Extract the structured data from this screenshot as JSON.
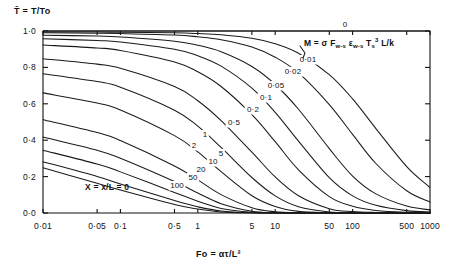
{
  "chart_data": {
    "type": "line",
    "title": "",
    "xlabel": "Fo = ατ/L²",
    "ylabel": "T̄ = T/To",
    "xscale": "log",
    "xlim": [
      0.01,
      1000
    ],
    "ylim": [
      0.0,
      1.0
    ],
    "grid": false,
    "legend_position": "inline-curve-labels",
    "x_tick_labels": [
      "0·01",
      "0·05",
      "0·1",
      "0·5",
      "1",
      "5",
      "10",
      "50",
      "100",
      "500",
      "1000"
    ],
    "x_tick_values": [
      0.01,
      0.05,
      0.1,
      0.5,
      1,
      5,
      10,
      50,
      100,
      500,
      1000
    ],
    "y_tick_labels": [
      "1·0",
      "0·8",
      "0·6",
      "0·4",
      "0·2",
      "0·0"
    ],
    "y_tick_values": [
      1.0,
      0.8,
      0.6,
      0.4,
      0.2,
      0.0
    ],
    "annotation_formula": "M = σ F",
    "annotation_formula_sub1": "w-s",
    "annotation_formula_mid": " ε",
    "annotation_formula_sub2": "w-s",
    "annotation_formula_T": " T",
    "annotation_formula_Tsub": "s",
    "annotation_formula_Tsup": "3",
    "annotation_formula_tail": " L/k",
    "annotation_position_note": "M=",
    "inside_label": "X = x/L = 0",
    "series_param_name": "M",
    "series": [
      {
        "name": "0",
        "label": "0",
        "M": 0
      },
      {
        "name": "0.01",
        "label": "0·01",
        "M": 0.01
      },
      {
        "name": "0.02",
        "label": "0·02",
        "M": 0.02
      },
      {
        "name": "0.05",
        "label": "0·05",
        "M": 0.05
      },
      {
        "name": "0.1",
        "label": "0·1",
        "M": 0.1
      },
      {
        "name": "0.2",
        "label": "0·2",
        "M": 0.2
      },
      {
        "name": "0.5",
        "label": "0·5",
        "M": 0.5
      },
      {
        "name": "1",
        "label": "1",
        "M": 1
      },
      {
        "name": "2",
        "label": "2",
        "M": 2
      },
      {
        "name": "5",
        "label": "5",
        "M": 5
      },
      {
        "name": "10",
        "label": "10",
        "M": 10
      },
      {
        "name": "20",
        "label": "20",
        "M": 20
      },
      {
        "name": "50",
        "label": "50",
        "M": 50
      },
      {
        "name": "100",
        "label": "100",
        "M": 100
      }
    ],
    "curve_points": {
      "0": [
        [
          0.01,
          1.0
        ],
        [
          0.1,
          1.0
        ],
        [
          1,
          1.0
        ],
        [
          10,
          1.0
        ],
        [
          100,
          1.0
        ],
        [
          1000,
          1.0
        ]
      ],
      "0.01": [
        [
          0.01,
          0.995
        ],
        [
          0.05,
          0.994
        ],
        [
          0.1,
          0.993
        ],
        [
          0.5,
          0.99
        ],
        [
          1,
          0.986
        ],
        [
          2,
          0.979
        ],
        [
          5,
          0.96
        ],
        [
          10,
          0.93
        ],
        [
          20,
          0.878
        ],
        [
          50,
          0.76
        ],
        [
          100,
          0.627
        ],
        [
          200,
          0.464
        ],
        [
          500,
          0.255
        ],
        [
          1000,
          0.14
        ]
      ],
      "0.02": [
        [
          0.01,
          0.99
        ],
        [
          0.05,
          0.988
        ],
        [
          0.1,
          0.986
        ],
        [
          0.5,
          0.978
        ],
        [
          1,
          0.968
        ],
        [
          2,
          0.952
        ],
        [
          5,
          0.912
        ],
        [
          10,
          0.856
        ],
        [
          20,
          0.77
        ],
        [
          50,
          0.596
        ],
        [
          100,
          0.432
        ],
        [
          200,
          0.272
        ],
        [
          500,
          0.122
        ],
        [
          1000,
          0.06
        ]
      ],
      "0.05": [
        [
          0.01,
          0.977
        ],
        [
          0.05,
          0.972
        ],
        [
          0.1,
          0.967
        ],
        [
          0.5,
          0.944
        ],
        [
          1,
          0.922
        ],
        [
          2,
          0.886
        ],
        [
          5,
          0.805
        ],
        [
          10,
          0.706
        ],
        [
          20,
          0.57
        ],
        [
          50,
          0.354
        ],
        [
          100,
          0.203
        ],
        [
          200,
          0.105
        ],
        [
          500,
          0.038
        ],
        [
          1000,
          0.017
        ]
      ],
      "0.1": [
        [
          0.01,
          0.957
        ],
        [
          0.05,
          0.948
        ],
        [
          0.1,
          0.94
        ],
        [
          0.5,
          0.9
        ],
        [
          1,
          0.864
        ],
        [
          2,
          0.807
        ],
        [
          5,
          0.686
        ],
        [
          10,
          0.553
        ],
        [
          20,
          0.395
        ],
        [
          50,
          0.194
        ],
        [
          100,
          0.094
        ],
        [
          200,
          0.042
        ],
        [
          500,
          0.013
        ],
        [
          1000,
          0.006
        ]
      ],
      "0.2": [
        [
          0.01,
          0.923
        ],
        [
          0.05,
          0.907
        ],
        [
          0.1,
          0.893
        ],
        [
          0.5,
          0.83
        ],
        [
          1,
          0.776
        ],
        [
          2,
          0.695
        ],
        [
          5,
          0.54
        ],
        [
          10,
          0.392
        ],
        [
          20,
          0.237
        ],
        [
          50,
          0.09
        ],
        [
          100,
          0.037
        ],
        [
          200,
          0.014
        ],
        [
          500,
          0.004
        ],
        [
          1000,
          0.002
        ]
      ],
      "0.5": [
        [
          0.01,
          0.848
        ],
        [
          0.05,
          0.818
        ],
        [
          0.1,
          0.795
        ],
        [
          0.5,
          0.695
        ],
        [
          1,
          0.617
        ],
        [
          2,
          0.508
        ],
        [
          5,
          0.334
        ],
        [
          10,
          0.198
        ],
        [
          20,
          0.095
        ],
        [
          50,
          0.024
        ],
        [
          100,
          0.008
        ],
        [
          200,
          0.003
        ],
        [
          500,
          0.001
        ],
        [
          1000,
          0.0
        ]
      ],
      "1": [
        [
          0.01,
          0.765
        ],
        [
          0.05,
          0.722
        ],
        [
          0.1,
          0.691
        ],
        [
          0.5,
          0.565
        ],
        [
          1,
          0.477
        ],
        [
          2,
          0.36
        ],
        [
          5,
          0.195
        ],
        [
          10,
          0.094
        ],
        [
          20,
          0.035
        ],
        [
          50,
          0.006
        ],
        [
          100,
          0.002
        ],
        [
          200,
          0.001
        ],
        [
          500,
          0.0
        ],
        [
          1000,
          0.0
        ]
      ],
      "2": [
        [
          0.01,
          0.66
        ],
        [
          0.05,
          0.604
        ],
        [
          0.1,
          0.566
        ],
        [
          0.5,
          0.425
        ],
        [
          1,
          0.336
        ],
        [
          2,
          0.227
        ],
        [
          5,
          0.095
        ],
        [
          10,
          0.036
        ],
        [
          20,
          0.009
        ],
        [
          50,
          0.001
        ],
        [
          100,
          0.0
        ],
        [
          200,
          0.0
        ],
        [
          500,
          0.0
        ],
        [
          1000,
          0.0
        ]
      ],
      "5": [
        [
          0.01,
          0.512
        ],
        [
          0.05,
          0.442
        ],
        [
          0.1,
          0.398
        ],
        [
          0.5,
          0.258
        ],
        [
          1,
          0.182
        ],
        [
          2,
          0.101
        ],
        [
          5,
          0.029
        ],
        [
          10,
          0.007
        ],
        [
          20,
          0.001
        ],
        [
          50,
          0.0
        ],
        [
          100,
          0.0
        ],
        [
          200,
          0.0
        ],
        [
          500,
          0.0
        ],
        [
          1000,
          0.0
        ]
      ],
      "10": [
        [
          0.01,
          0.418
        ],
        [
          0.05,
          0.345
        ],
        [
          0.1,
          0.301
        ],
        [
          0.5,
          0.173
        ],
        [
          1,
          0.11
        ],
        [
          2,
          0.051
        ],
        [
          5,
          0.01
        ],
        [
          10,
          0.002
        ],
        [
          20,
          0.0
        ],
        [
          50,
          0.0
        ],
        [
          100,
          0.0
        ],
        [
          200,
          0.0
        ],
        [
          500,
          0.0
        ],
        [
          1000,
          0.0
        ]
      ],
      "20": [
        [
          0.01,
          0.345
        ],
        [
          0.05,
          0.269
        ],
        [
          0.1,
          0.226
        ],
        [
          0.5,
          0.113
        ],
        [
          1,
          0.065
        ],
        [
          2,
          0.025
        ],
        [
          5,
          0.004
        ],
        [
          10,
          0.001
        ],
        [
          20,
          0.0
        ],
        [
          50,
          0.0
        ],
        [
          100,
          0.0
        ],
        [
          200,
          0.0
        ],
        [
          500,
          0.0
        ],
        [
          1000,
          0.0
        ]
      ],
      "50": [
        [
          0.01,
          0.282
        ],
        [
          0.05,
          0.201
        ],
        [
          0.1,
          0.16
        ],
        [
          0.5,
          0.068
        ],
        [
          1,
          0.034
        ],
        [
          2,
          0.011
        ],
        [
          5,
          0.001
        ],
        [
          10,
          0.0
        ],
        [
          20,
          0.0
        ],
        [
          50,
          0.0
        ],
        [
          100,
          0.0
        ],
        [
          200,
          0.0
        ],
        [
          500,
          0.0
        ],
        [
          1000,
          0.0
        ]
      ],
      "100": [
        [
          0.01,
          0.248
        ],
        [
          0.05,
          0.164
        ],
        [
          0.1,
          0.126
        ],
        [
          0.5,
          0.047
        ],
        [
          1,
          0.022
        ],
        [
          2,
          0.006
        ],
        [
          5,
          0.001
        ],
        [
          10,
          0.0
        ],
        [
          20,
          0.0
        ],
        [
          50,
          0.0
        ],
        [
          100,
          0.0
        ],
        [
          200,
          0.0
        ],
        [
          500,
          0.0
        ],
        [
          1000,
          0.0
        ]
      ]
    },
    "curve_label_positions": {
      "0": [
        345,
        27
      ],
      "0.01": [
        308,
        62
      ],
      "0.02": [
        293,
        74
      ],
      "0.05": [
        276,
        88
      ],
      "0.1": [
        266,
        100
      ],
      "0.2": [
        253,
        112
      ],
      "0.5": [
        234,
        125
      ],
      "1": [
        205,
        137
      ],
      "2": [
        194,
        148
      ],
      "5": [
        221,
        156
      ],
      "10": [
        213,
        164
      ],
      "20": [
        201,
        172
      ],
      "50": [
        193,
        180
      ],
      "100": [
        177,
        188
      ]
    },
    "axes": {
      "left_px": 43,
      "right_px": 430,
      "top_px": 31,
      "bottom_px": 213
    },
    "colors": {
      "axis": "#111111",
      "curve": "#1a1a1a",
      "background": "#ffffff"
    }
  }
}
